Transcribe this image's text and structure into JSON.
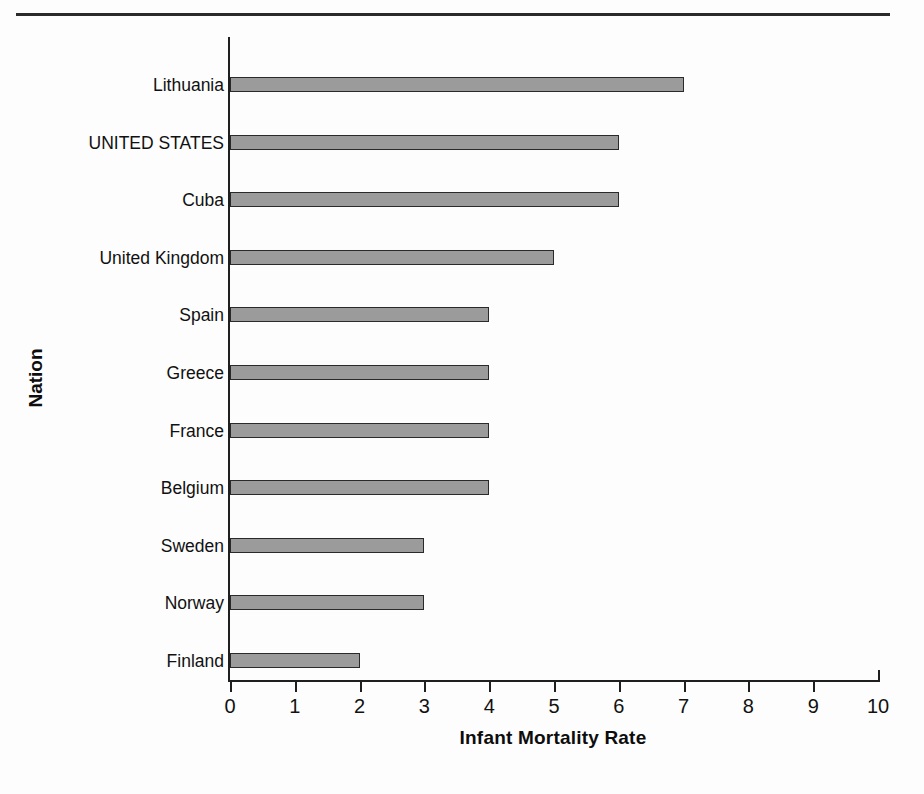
{
  "figure": {
    "has_top_rule": true,
    "background_color": "#fdfdfd",
    "bar_fill_color": "#9b9b9b",
    "bar_border_color": "#2a2a2a",
    "axis_color": "#1f1f1f"
  },
  "chart_data": {
    "type": "bar",
    "orientation": "horizontal",
    "title": "",
    "xlabel": "Infant Mortality Rate",
    "ylabel": "Nation",
    "categories": [
      "Lithuania",
      "UNITED STATES",
      "Cuba",
      "United Kingdom",
      "Spain",
      "Greece",
      "France",
      "Belgium",
      "Sweden",
      "Norway",
      "Finland"
    ],
    "values": [
      7,
      6,
      6,
      5,
      4,
      4,
      4,
      4,
      3,
      3,
      2
    ],
    "xlim": [
      0,
      10
    ],
    "xticks": [
      0,
      1,
      2,
      3,
      4,
      5,
      6,
      7,
      8,
      9,
      10
    ],
    "xtick_labels": [
      "0",
      "1",
      "2",
      "3",
      "4",
      "5",
      "6",
      "7",
      "8",
      "9",
      "10"
    ],
    "grid": false,
    "legend": null
  }
}
